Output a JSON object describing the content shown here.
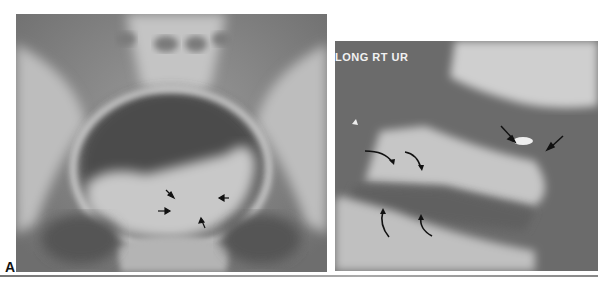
{
  "figure": {
    "panel_label": "A",
    "left_image": {
      "type": "pelvic radiograph",
      "arrow_count": 4
    },
    "right_image": {
      "type": "ultrasound",
      "overlay_text": "LONG RT UR",
      "straight_arrow_count": 2,
      "curved_arrow_count": 4
    }
  },
  "colors": {
    "background": "#ffffff",
    "xray_mid": "#8a8a8a",
    "us_mid": "#6a6a6a",
    "label": "#111111"
  }
}
